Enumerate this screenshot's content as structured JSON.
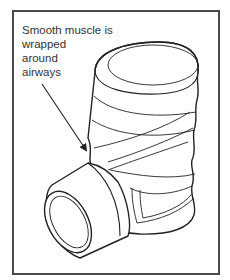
{
  "figure": {
    "type": "line-art illustration",
    "label_lines": [
      "Smooth muscle is",
      "wrapped",
      "around",
      "airways"
    ],
    "colors": {
      "frame": "#4a4a4a",
      "stroke": "#222222",
      "text": "#333333",
      "background": "#ffffff"
    }
  }
}
